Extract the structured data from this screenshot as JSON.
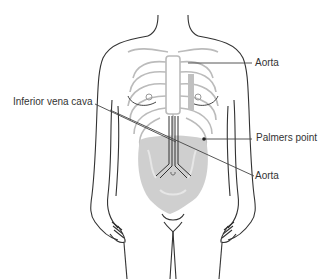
{
  "diagram": {
    "labels": [
      {
        "id": "aorta-upper",
        "text": "Aorta",
        "x": 255,
        "y": 57
      },
      {
        "id": "inferior-vena-cava",
        "text": "Inferior vena cava",
        "x": 13,
        "y": 96
      },
      {
        "id": "palmers-point",
        "text": "Palmers point",
        "x": 256,
        "y": 132
      },
      {
        "id": "aorta-lower",
        "text": "Aorta",
        "x": 255,
        "y": 170
      }
    ],
    "colors": {
      "outline": "#333333",
      "bone": "#bbbbbb",
      "organs": "#c4c4c4",
      "leader_line": "#444444",
      "background": "#ffffff"
    }
  }
}
